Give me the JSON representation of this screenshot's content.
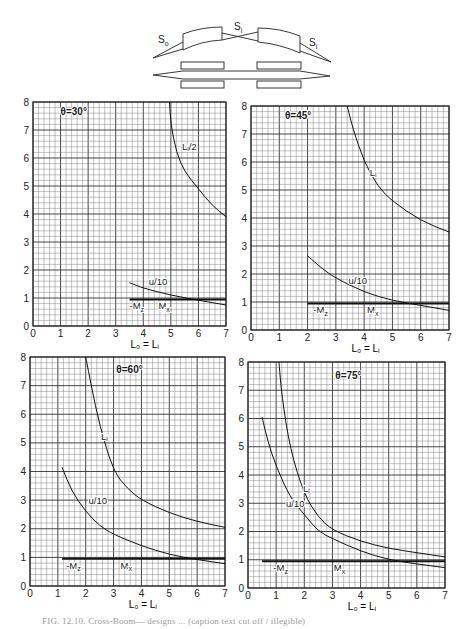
{
  "figure": {
    "diagram": {
      "labels": {
        "s_o": "S",
        "s_o_sub": "o",
        "s_i_top": "S",
        "s_i_top_sub": "i",
        "s_i_right": "S",
        "s_i_right_sub": "i"
      }
    },
    "caption": "FIG. 12.10. Cross-Boom— designs ... (caption text cut off / illegible)"
  },
  "chart_data": [
    {
      "type": "line",
      "title": "θ=30°",
      "xlabel": "L₀ = Lᵢ",
      "ylabel": "",
      "xlim": [
        0,
        7
      ],
      "ylim": [
        0,
        8
      ],
      "xticks": [
        "0",
        "1",
        "2",
        "3",
        "4",
        "5",
        "6",
        "7"
      ],
      "yticks": [
        "0",
        "1",
        "2",
        "3",
        "4",
        "5",
        "6",
        "7",
        "8"
      ],
      "grid": true,
      "series": [
        {
          "name": "Lᵢ/2",
          "x": [
            4.95,
            5.0,
            5.2,
            5.5,
            6.0,
            6.5,
            7.0
          ],
          "y": [
            8.0,
            7.2,
            6.2,
            5.5,
            4.9,
            4.3,
            3.9
          ]
        },
        {
          "name": "u/10",
          "x": [
            3.5,
            4.0,
            5.0,
            6.0,
            7.0
          ],
          "y": [
            1.55,
            1.35,
            1.1,
            0.92,
            0.75
          ]
        },
        {
          "name": "M_z / M_x",
          "x": [
            3.5,
            7.0
          ],
          "y": [
            0.95,
            0.95
          ],
          "bold": true
        }
      ],
      "annotations": [
        {
          "text": "θ=30°",
          "x": 1.0,
          "y": 7.55
        },
        {
          "text": "Lᵢ/2",
          "x": 5.4,
          "y": 6.3
        },
        {
          "text": "u/10",
          "x": 4.2,
          "y": 1.45
        },
        {
          "text": "-M_z",
          "x": 3.5,
          "y": 0.6
        },
        {
          "text": "M_x",
          "x": 4.55,
          "y": 0.6
        }
      ]
    },
    {
      "type": "line",
      "title": "θ=45°",
      "xlabel": "L₀ = Lᵢ",
      "ylabel": "",
      "xlim": [
        0,
        7
      ],
      "ylim": [
        0,
        8
      ],
      "xticks": [
        "0",
        "1",
        "2",
        "3",
        "4",
        "5",
        "6",
        "7"
      ],
      "yticks": [
        "0",
        "1",
        "2",
        "3",
        "4",
        "5",
        "6",
        "7",
        "8"
      ],
      "grid": true,
      "series": [
        {
          "name": "Lᵢ",
          "x": [
            3.4,
            3.6,
            4.0,
            4.5,
            5.0,
            6.0,
            7.0
          ],
          "y": [
            8.0,
            7.2,
            6.0,
            5.1,
            4.6,
            3.9,
            3.5
          ]
        },
        {
          "name": "u/10",
          "x": [
            2.0,
            2.5,
            3.0,
            4.0,
            5.0,
            6.0,
            7.0
          ],
          "y": [
            2.65,
            2.2,
            1.85,
            1.35,
            1.05,
            0.88,
            0.7
          ]
        },
        {
          "name": "M_z / M_x",
          "x": [
            2.0,
            7.0
          ],
          "y": [
            0.95,
            0.95
          ],
          "bold": true
        }
      ],
      "annotations": [
        {
          "text": "θ=45°",
          "x": 1.2,
          "y": 7.55
        },
        {
          "text": "Lᵢ",
          "x": 4.2,
          "y": 5.5
        },
        {
          "text": "u/10",
          "x": 3.45,
          "y": 1.65
        },
        {
          "text": "-M_z",
          "x": 2.2,
          "y": 0.6
        },
        {
          "text": "M_x",
          "x": 4.1,
          "y": 0.6
        }
      ]
    },
    {
      "type": "line",
      "title": "θ=60°",
      "xlabel": "L₀ = Lᵢ",
      "ylabel": "",
      "xlim": [
        0,
        7
      ],
      "ylim": [
        0,
        8
      ],
      "xticks": [
        "0",
        "1",
        "2",
        "3",
        "4",
        "5",
        "6",
        "7"
      ],
      "yticks": [
        "0",
        "1",
        "2",
        "3",
        "4",
        "5",
        "6",
        "7",
        "8"
      ],
      "grid": true,
      "series": [
        {
          "name": "Lᵢ",
          "x": [
            2.0,
            2.2,
            2.5,
            3.0,
            3.5,
            4.0,
            5.0,
            6.0,
            7.0
          ],
          "y": [
            8.0,
            7.0,
            5.6,
            4.0,
            3.4,
            3.0,
            2.55,
            2.25,
            2.05
          ]
        },
        {
          "name": "u/10",
          "x": [
            1.15,
            1.5,
            2.0,
            2.5,
            3.0,
            4.0,
            5.0,
            6.0,
            7.0
          ],
          "y": [
            4.15,
            3.3,
            2.6,
            2.1,
            1.8,
            1.4,
            1.1,
            0.92,
            0.78
          ]
        },
        {
          "name": "M_z / M_x",
          "x": [
            1.15,
            7.0
          ],
          "y": [
            0.95,
            0.95
          ],
          "bold": true
        }
      ],
      "annotations": [
        {
          "text": "θ=60°",
          "x": 3.1,
          "y": 7.45
        },
        {
          "text": "Lᵢ",
          "x": 2.55,
          "y": 5.1
        },
        {
          "text": "u/10",
          "x": 2.1,
          "y": 2.85
        },
        {
          "text": "-M_z",
          "x": 1.3,
          "y": 0.6
        },
        {
          "text": "M_x",
          "x": 3.25,
          "y": 0.6
        }
      ]
    },
    {
      "type": "line",
      "title": "θ=75°",
      "xlabel": "L₀ = Lᵢ",
      "ylabel": "",
      "xlim": [
        0,
        7
      ],
      "ylim": [
        0,
        8
      ],
      "xticks": [
        "0",
        "1",
        "2",
        "3",
        "4",
        "5",
        "6",
        "7"
      ],
      "yticks": [
        "0",
        "1",
        "2",
        "3",
        "4",
        "5",
        "6",
        "7",
        "8"
      ],
      "grid": true,
      "series": [
        {
          "name": "Lᵢ",
          "x": [
            1.1,
            1.2,
            1.5,
            2.0,
            2.5,
            3.0,
            4.0,
            5.0,
            6.0,
            7.0
          ],
          "y": [
            8.0,
            6.8,
            4.9,
            3.3,
            2.5,
            2.05,
            1.65,
            1.4,
            1.25,
            1.1
          ]
        },
        {
          "name": "u/10",
          "x": [
            0.5,
            0.7,
            1.0,
            1.5,
            2.0,
            2.5,
            3.0,
            4.0,
            5.0,
            6.0,
            7.0
          ],
          "y": [
            6.05,
            5.2,
            4.3,
            3.2,
            2.6,
            2.0,
            1.75,
            1.3,
            1.0,
            0.85,
            0.72
          ]
        },
        {
          "name": "M_z / M_x",
          "x": [
            0.5,
            7.0
          ],
          "y": [
            0.95,
            0.95
          ],
          "bold": true
        }
      ],
      "annotations": [
        {
          "text": "θ=75°",
          "x": 3.1,
          "y": 7.4
        },
        {
          "text": "Lᵢ",
          "x": 1.95,
          "y": 3.4
        },
        {
          "text": "u/10",
          "x": 1.35,
          "y": 2.85
        },
        {
          "text": "-M_z",
          "x": 0.9,
          "y": 0.6
        },
        {
          "text": "M_x",
          "x": 3.05,
          "y": 0.6
        }
      ]
    }
  ]
}
